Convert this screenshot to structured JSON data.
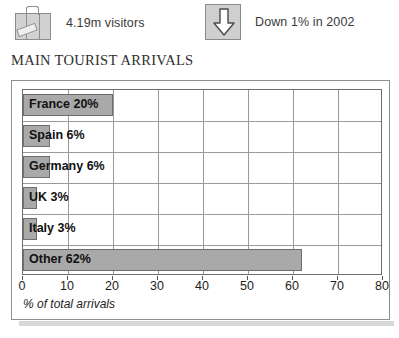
{
  "header": {
    "visitors": {
      "icon": "suitcase-icon",
      "text": "4.19m visitors"
    },
    "trend": {
      "icon": "down-arrow-icon",
      "text": "Down 1% in 2002"
    }
  },
  "title": "MAIN TOURIST ARRIVALS",
  "chart_data": {
    "type": "bar",
    "orientation": "horizontal",
    "title": "MAIN TOURIST ARRIVALS",
    "xlabel": "% of total arrivals",
    "ylabel": "",
    "xlim": [
      0,
      80
    ],
    "xticks": [
      0,
      10,
      20,
      30,
      40,
      50,
      60,
      70,
      80
    ],
    "xtick_labels": [
      "0",
      "10",
      "20",
      "30",
      "40",
      "50",
      "60",
      "70",
      "80"
    ],
    "grid": true,
    "legend": false,
    "categories": [
      "France",
      "Spain",
      "Germany",
      "UK",
      "Italy",
      "Other"
    ],
    "values": [
      20,
      6,
      6,
      3,
      3,
      62
    ],
    "bar_labels": [
      "France 20%",
      "Spain 6%",
      "Germany 6%",
      "UK 3%",
      "Italy 3%",
      "Other 62%"
    ],
    "colors": {
      "bar_fill": "#a9a9a9",
      "bar_stroke": "#6d6d6d",
      "grid": "#9a9a9a",
      "axis": "#6e6e6e",
      "label_text": "#111111"
    }
  }
}
